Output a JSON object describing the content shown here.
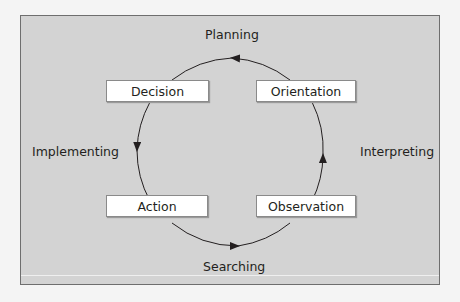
{
  "diagram": {
    "type": "cycle",
    "nodes": {
      "decision": "Decision",
      "orientation": "Orientation",
      "action": "Action",
      "observation": "Observation"
    },
    "edge_labels": {
      "top": "Planning",
      "left": "Implementing",
      "right": "Interpreting",
      "bottom": "Searching"
    },
    "flow": [
      "Observation",
      "Orientation",
      "Decision",
      "Action",
      "Observation"
    ],
    "colors": {
      "background": "#d3d3d3",
      "node_fill": "#ffffff",
      "stroke": "#231f20"
    }
  }
}
